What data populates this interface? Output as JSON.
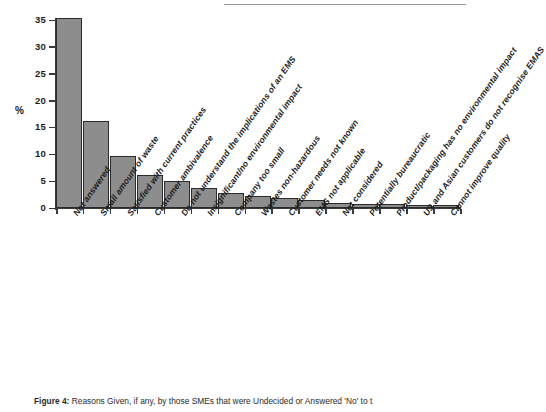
{
  "figure": {
    "caption_label": "Figure 4:",
    "caption_text": "Reasons Given, if any, by those SMEs that were Undecided or Answered 'No' to t"
  },
  "axes": {
    "ylabel": "%",
    "yticks": [
      "0",
      "5",
      "10",
      "15",
      "20",
      "25",
      "30",
      "35"
    ],
    "bar_fill": "#8d8d8d",
    "bar_stroke": "#2b2b2b",
    "axis_color": "#3a3a3a"
  },
  "chart_data": {
    "type": "bar",
    "title": "Reasons Given, if any, by those SMEs that were Undecided or Answered 'No' to t",
    "xlabel": "",
    "ylabel": "%",
    "ylim": [
      0,
      35
    ],
    "grid": false,
    "legend": "none",
    "categories": [
      "Not answered",
      "Small amount of waste",
      "Satisfied with current practices",
      "Customer ambivalence",
      "Do not understand the implications of an EMS",
      "Insignificant/no environmental impact",
      "Company too small",
      "Wastes non-hazardous",
      "Customer needs not known",
      "EMS not applicable",
      "Not considered",
      "Potentially bureaucratic",
      "Product/packaging has no environmental impact",
      "US and Asian customers do not recognise EMAS",
      "Cannot improve quality"
    ],
    "values": [
      35.3,
      16.2,
      9.7,
      6.1,
      5.0,
      3.7,
      2.8,
      2.3,
      1.8,
      1.4,
      1.0,
      0.8,
      0.7,
      0.6,
      0.5
    ]
  }
}
